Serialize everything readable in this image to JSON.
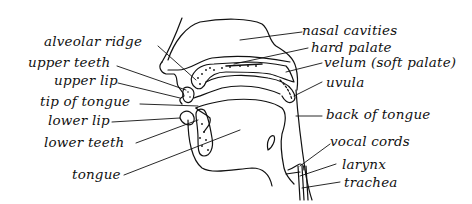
{
  "diagram": {
    "type": "anatomical-labeled-diagram",
    "stroke_color": "#111111",
    "background": "#ffffff",
    "labels_left": [
      {
        "id": "alveolar-ridge",
        "text": "alveolar ridge"
      },
      {
        "id": "upper-teeth",
        "text": "upper teeth"
      },
      {
        "id": "upper-lip",
        "text": "upper lip"
      },
      {
        "id": "tip-of-tongue",
        "text": "tip of tongue"
      },
      {
        "id": "lower-lip",
        "text": "lower lip"
      },
      {
        "id": "lower-teeth",
        "text": "lower teeth"
      },
      {
        "id": "tongue",
        "text": "tongue"
      }
    ],
    "labels_right": [
      {
        "id": "nasal-cavities",
        "text": "nasal cavities"
      },
      {
        "id": "hard-palate",
        "text": "hard palate"
      },
      {
        "id": "velum",
        "text": "velum (soft palate)"
      },
      {
        "id": "uvula",
        "text": "uvula"
      },
      {
        "id": "back-of-tongue",
        "text": "back of tongue"
      },
      {
        "id": "vocal-cords",
        "text": "vocal cords"
      },
      {
        "id": "larynx",
        "text": "larynx"
      },
      {
        "id": "trachea",
        "text": "trachea"
      }
    ]
  }
}
